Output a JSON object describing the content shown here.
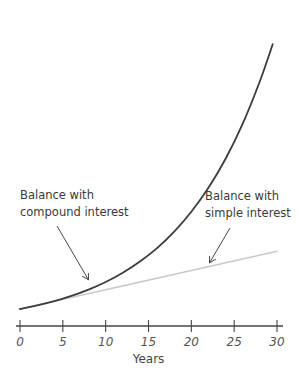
{
  "chart_data": {
    "type": "line",
    "title": "",
    "xlabel": "Years",
    "ylabel": "",
    "xlim": [
      0,
      30
    ],
    "ylim": [
      0,
      20
    ],
    "x_ticks": [
      0,
      5,
      10,
      15,
      20,
      25,
      30
    ],
    "x_tick_labels": [
      "0",
      "5",
      "10",
      "15",
      "20",
      "25",
      "30"
    ],
    "y_axis_visible": false,
    "grid": false,
    "series": [
      {
        "name": "Balance with compound interest",
        "color": "#3c3c3c",
        "x": [
          0,
          2,
          4,
          6,
          8,
          10,
          12,
          14,
          16,
          18,
          20,
          22,
          24,
          26,
          28,
          29.5
        ],
        "values": [
          1.0,
          1.21,
          1.46,
          1.77,
          2.14,
          2.59,
          3.14,
          3.8,
          4.59,
          5.56,
          6.73,
          8.14,
          9.85,
          11.92,
          14.42,
          16.6
        ]
      },
      {
        "name": "Balance with simple interest",
        "color": "#c8c8c8",
        "x": [
          0,
          30
        ],
        "values": [
          1.0,
          4.4
        ]
      }
    ],
    "annotations": [
      {
        "lines": [
          "Balance with",
          "compound interest"
        ],
        "points_to": "Balance with compound interest",
        "at_x": 8
      },
      {
        "lines": [
          "Balance with",
          "simple interest"
        ],
        "points_to": "Balance with simple interest",
        "at_x": 22
      }
    ]
  }
}
